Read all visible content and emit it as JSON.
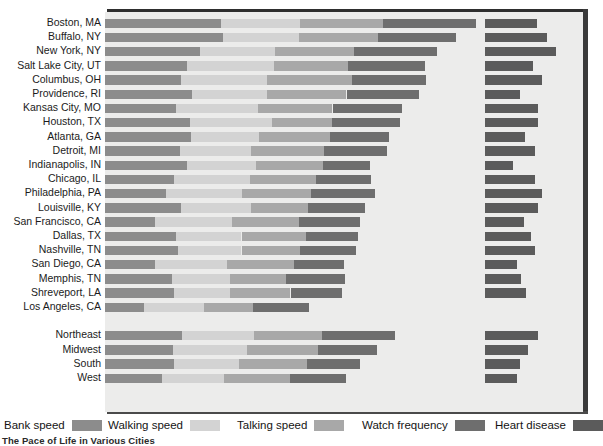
{
  "caption": "The Pace of Life in Various Cities",
  "legend": {
    "items": [
      {
        "label": "Bank speed",
        "color": "#8c8c8c",
        "x": 4
      },
      {
        "label": "Walking speed",
        "color": "#d3d3d3",
        "x": 108
      },
      {
        "label": "Talking speed",
        "color": "#a8a8a8",
        "x": 237
      },
      {
        "label": "Watch frequency",
        "color": "#6e6e6e",
        "x": 362
      },
      {
        "label": "Heart disease",
        "color": "#5b5b5b",
        "x": 495
      }
    ]
  },
  "chart_data": {
    "type": "bar",
    "subtype": "stacked-horizontal",
    "title": "The Pace of Life in Various Cities",
    "xlabel": "",
    "ylabel": "",
    "grid": false,
    "legend_position": "bottom",
    "note": "Bank speed, Walking speed, Talking speed and Watch frequency are stacked from the left axis. Heart disease is drawn as a separate bar offset to the right of the stack. Values are rank-style units read off the bar pixel widths.",
    "series": [
      {
        "name": "Bank speed",
        "color": "#8c8c8c"
      },
      {
        "name": "Walking speed",
        "color": "#d3d3d3"
      },
      {
        "name": "Talking speed",
        "color": "#a8a8a8"
      },
      {
        "name": "Watch frequency",
        "color": "#6e6e6e"
      },
      {
        "name": "Heart disease",
        "color": "#5b5b5b",
        "offset_start": 380
      }
    ],
    "categories": [
      "Boston, MA",
      "Buffalo, NY",
      "New York, NY",
      "Salt Lake City, UT",
      "Columbus, OH",
      "Providence, RI",
      "Kansas City, MO",
      "Houston, TX",
      "Atlanta, GA",
      "Detroit, MI",
      "Indianapolis, IN",
      "Chicago, IL",
      "Philadelphia, PA",
      "Louisville, KY",
      "San Francisco, CA",
      "Dallas, TX",
      "Nashville, TN",
      "San Diego, CA",
      "Memphis, TN",
      "Shreveport, LA",
      "Los Angeles, CA",
      "Northeast",
      "Midwest",
      "South",
      "West"
    ],
    "rows": [
      {
        "label": "Boston, MA",
        "bank": 166,
        "walking": 113,
        "talking": 118,
        "watch": 133,
        "heart": 74
      },
      {
        "label": "Buffalo, NY",
        "bank": 169,
        "walking": 108,
        "talking": 113,
        "watch": 111,
        "heart": 89
      },
      {
        "label": "New York, NY",
        "bank": 136,
        "walking": 107,
        "talking": 113,
        "watch": 119,
        "heart": 101
      },
      {
        "label": "Salt Lake City, UT",
        "bank": 117,
        "walking": 125,
        "talking": 105,
        "watch": 110,
        "heart": 69
      },
      {
        "label": "Columbus, OH",
        "bank": 109,
        "walking": 122,
        "talking": 122,
        "watch": 105,
        "heart": 81
      },
      {
        "label": "Providence, RI",
        "bank": 124,
        "walking": 108,
        "talking": 113,
        "watch": 103,
        "heart": 50
      },
      {
        "label": "Kansas City, MO",
        "bank": 102,
        "walking": 116,
        "talking": 107,
        "watch": 99,
        "heart": 75
      },
      {
        "label": "Houston, TX",
        "bank": 121,
        "walking": 118,
        "talking": 85,
        "watch": 98,
        "heart": 76
      },
      {
        "label": "Atlanta, GA",
        "bank": 123,
        "walking": 97,
        "talking": 102,
        "watch": 84,
        "heart": 57
      },
      {
        "label": "Detroit, MI",
        "bank": 107,
        "walking": 101,
        "talking": 105,
        "watch": 90,
        "heart": 72
      },
      {
        "label": "Indianapolis, IN",
        "bank": 117,
        "walking": 99,
        "talking": 96,
        "watch": 67,
        "heart": 40
      },
      {
        "label": "Chicago, IL",
        "bank": 99,
        "walking": 108,
        "talking": 94,
        "watch": 79,
        "heart": 71
      },
      {
        "label": "Philadelphia, PA",
        "bank": 87,
        "walking": 109,
        "talking": 98,
        "watch": 92,
        "heart": 81
      },
      {
        "label": "Louisville, KY",
        "bank": 108,
        "walking": 101,
        "talking": 81,
        "watch": 82,
        "heart": 76
      },
      {
        "label": "San Francisco, CA",
        "bank": 71,
        "walking": 110,
        "talking": 96,
        "watch": 88,
        "heart": 56
      },
      {
        "label": "Dallas, TX",
        "bank": 101,
        "walking": 94,
        "talking": 92,
        "watch": 74,
        "heart": 65
      },
      {
        "label": "Nashville, TN",
        "bank": 104,
        "walking": 91,
        "talking": 83,
        "watch": 80,
        "heart": 72
      },
      {
        "label": "San Diego, CA",
        "bank": 71,
        "walking": 103,
        "talking": 96,
        "watch": 72,
        "heart": 46
      },
      {
        "label": "Memphis, TN",
        "bank": 96,
        "walking": 82,
        "talking": 80,
        "watch": 85,
        "heart": 52
      },
      {
        "label": "Shreveport, LA",
        "bank": 99,
        "walking": 79,
        "talking": 87,
        "watch": 73,
        "heart": 58
      },
      {
        "label": "Los Angeles, CA",
        "bank": 55,
        "walking": 87,
        "talking": 70,
        "watch": 80,
        "heart": 0
      },
      {
        "label": "Northeast",
        "bank": 110,
        "walking": 103,
        "talking": 97,
        "watch": 104,
        "heart": 75
      },
      {
        "label": "Midwest",
        "bank": 97,
        "walking": 106,
        "talking": 101,
        "watch": 85,
        "heart": 62
      },
      {
        "label": "South",
        "bank": 99,
        "walking": 92,
        "talking": 97,
        "watch": 76,
        "heart": 50
      },
      {
        "label": "West",
        "bank": 81,
        "walking": 89,
        "talking": 94,
        "watch": 80,
        "heart": 46
      }
    ],
    "row_gap_after": [
      20
    ],
    "axis_start_px": 105,
    "heart_start_px": 485
  }
}
